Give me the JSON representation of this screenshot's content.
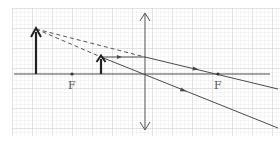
{
  "diagram": {
    "colors": {
      "background": "#ffffff",
      "grid_minor": "#dcdcdc",
      "grid_major": "#c4c4c4",
      "axis": "#4a4a4a",
      "ray": "#4a4a4a",
      "dashed": "#555555",
      "arrow": "#222222"
    },
    "grid": {
      "x0": 12,
      "y0": 8,
      "x1": 280,
      "y1": 136,
      "minor": 4,
      "major": 20
    },
    "optical_axis": {
      "x1": 14,
      "x2": 270,
      "y": 74
    },
    "lens": {
      "x": 145,
      "y_top": 13,
      "y_bottom": 130,
      "type": "converging"
    },
    "focal_points": [
      {
        "label": "F",
        "x": 72,
        "y": 74
      },
      {
        "label": "F",
        "x": 218,
        "y": 74
      }
    ],
    "object": {
      "x": 101,
      "base_y": 74,
      "tip_y": 57
    },
    "image": {
      "x": 36,
      "base_y": 74,
      "tip_y": 29,
      "type": "virtual, upright, magnified"
    },
    "rays": [
      {
        "kind": "parallel",
        "from": [
          101,
          57
        ],
        "to": [
          145,
          57
        ],
        "arrow_at": [
          120,
          57
        ]
      },
      {
        "kind": "refracted-through-F",
        "from": [
          145,
          57
        ],
        "to": [
          278,
          89
        ],
        "arrow_at": [
          197,
          69
        ]
      },
      {
        "kind": "through-center",
        "from": [
          101,
          57
        ],
        "to": [
          278,
          128
        ],
        "arrow_at": [
          185,
          91
        ]
      }
    ],
    "virtual_extensions": [
      {
        "from": [
          36,
          29
        ],
        "to": [
          145,
          57
        ]
      },
      {
        "from": [
          36,
          29
        ],
        "to": [
          101,
          57
        ]
      }
    ]
  }
}
